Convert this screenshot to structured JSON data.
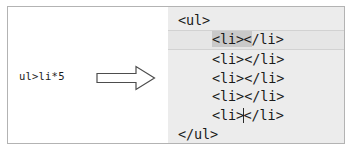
{
  "figure": {
    "border_color": "#b3b3b3",
    "background": "#ffffff"
  },
  "left_panel": {
    "abbreviation": "ul>li*5",
    "arrow": {
      "icon": "right-block-arrow-icon",
      "direction": "right",
      "fill": "#ffffff",
      "stroke": "#4d4d4d"
    }
  },
  "code_panel": {
    "background": "#ececec",
    "selection_color": "#c9c9c9",
    "active_row_color": "#e6e6e6",
    "caret_color": "#2b2b2b",
    "lines": [
      {
        "indent": false,
        "active": false,
        "text": "<ul>",
        "open_tag": "<ul>",
        "close_tag": "",
        "caret": false,
        "selected": false
      },
      {
        "indent": true,
        "active": true,
        "text": "<li></li>",
        "open_tag": "<li>",
        "close_tag": "</li>",
        "close_tag_head": "<",
        "close_tag_rest": "/li>",
        "caret": true,
        "selected": true
      },
      {
        "indent": true,
        "active": false,
        "text": "<li></li>",
        "open_tag": "<li>",
        "close_tag": "</li>",
        "caret": false,
        "selected": false
      },
      {
        "indent": true,
        "active": false,
        "text": "<li></li>",
        "open_tag": "<li>",
        "close_tag": "</li>",
        "caret": false,
        "selected": false
      },
      {
        "indent": true,
        "active": false,
        "text": "<li></li>",
        "open_tag": "<li>",
        "close_tag": "</li>",
        "caret": false,
        "selected": false
      },
      {
        "indent": true,
        "active": false,
        "text": "<li></li>",
        "open_tag": "<li>",
        "close_tag": "</li>",
        "caret": true,
        "selected": false
      },
      {
        "indent": false,
        "active": false,
        "text": "</ul>",
        "open_tag": "</ul>",
        "close_tag": "",
        "caret": false,
        "selected": false
      }
    ]
  }
}
